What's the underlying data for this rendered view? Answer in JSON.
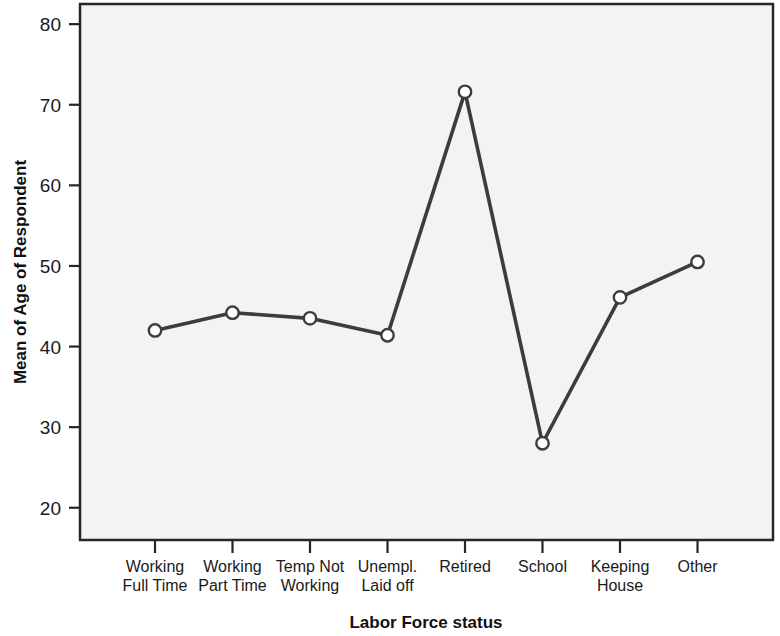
{
  "chart_data": {
    "type": "line",
    "title": "",
    "xlabel": "Labor Force status",
    "ylabel": "Mean of Age of Respondent",
    "categories": [
      "Working Full Time",
      "Working Part Time",
      "Temp Not Working",
      "Unempl. Laid off",
      "Retired",
      "School",
      "Keeping House",
      "Other"
    ],
    "category_lines": [
      [
        "Working",
        "Full Time"
      ],
      [
        "Working",
        "Part Time"
      ],
      [
        "Temp Not",
        "Working"
      ],
      [
        "Unempl.",
        "Laid off"
      ],
      [
        "Retired",
        ""
      ],
      [
        "School",
        ""
      ],
      [
        "Keeping",
        "House"
      ],
      [
        "Other",
        ""
      ]
    ],
    "values": [
      42.0,
      44.2,
      43.5,
      41.4,
      71.6,
      28.0,
      46.1,
      50.5
    ],
    "ytick_labels": [
      "80",
      "70",
      "60",
      "50",
      "40",
      "30",
      "20"
    ],
    "yticks": [
      80,
      70,
      60,
      50,
      40,
      30,
      20
    ],
    "ylim": [
      16,
      82.5
    ],
    "grid": false,
    "legend": "none",
    "marker": "open-circle",
    "series_color": "#3c3c3c",
    "plot_background": "#f3f3f3",
    "frame_color": "#262626"
  }
}
